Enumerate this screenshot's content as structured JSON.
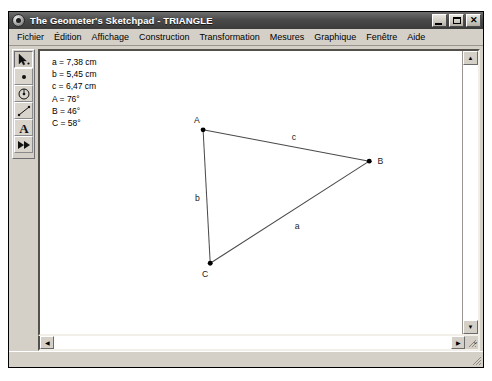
{
  "window": {
    "title": "The Geometer's Sketchpad - TRIANGLE",
    "icon": "sketchpad-circle-icon",
    "controls": {
      "minimize": "_",
      "maximize": "□",
      "close": "✕"
    }
  },
  "menubar": {
    "items": [
      {
        "label": "Fichier"
      },
      {
        "label": "Édition"
      },
      {
        "label": "Affichage"
      },
      {
        "label": "Construction"
      },
      {
        "label": "Transformation"
      },
      {
        "label": "Mesures"
      },
      {
        "label": "Graphique"
      },
      {
        "label": "Fenêtre"
      },
      {
        "label": "Aide"
      }
    ]
  },
  "toolbar": {
    "tools": [
      {
        "name": "selection-arrow-tool",
        "selected": true
      },
      {
        "name": "point-tool",
        "selected": false
      },
      {
        "name": "compass-circle-tool",
        "selected": false
      },
      {
        "name": "straightedge-segment-tool",
        "selected": false
      },
      {
        "name": "text-tool",
        "label": "A",
        "selected": false
      },
      {
        "name": "custom-transform-tool",
        "selected": false
      }
    ]
  },
  "measurements": [
    {
      "id": "side-a",
      "text": "a = 7,38 cm"
    },
    {
      "id": "side-b",
      "text": "b = 5,45 cm"
    },
    {
      "id": "side-c",
      "text": "c = 6,47 cm"
    },
    {
      "id": "angle-A",
      "text": "A = 76°"
    },
    {
      "id": "angle-B",
      "text": "B = 46°"
    },
    {
      "id": "angle-C",
      "text": "C = 58°"
    }
  ],
  "sketch": {
    "vertices": [
      {
        "label": "A",
        "x": 160,
        "y": 78
      },
      {
        "label": "B",
        "x": 323,
        "y": 109
      },
      {
        "label": "C",
        "x": 167,
        "y": 210
      }
    ],
    "side_labels": [
      {
        "label": "c",
        "x": 247,
        "y": 88
      },
      {
        "label": "b",
        "x": 152,
        "y": 148
      },
      {
        "label": "a",
        "x": 250,
        "y": 176
      }
    ],
    "line_color": "#4a4a4a",
    "point_color": "#000000"
  },
  "scrollbars": {
    "vertical": {
      "up": "▲",
      "down": "▼"
    },
    "horizontal": {
      "left": "◀",
      "right": "▶"
    },
    "chevron": "⌄"
  }
}
